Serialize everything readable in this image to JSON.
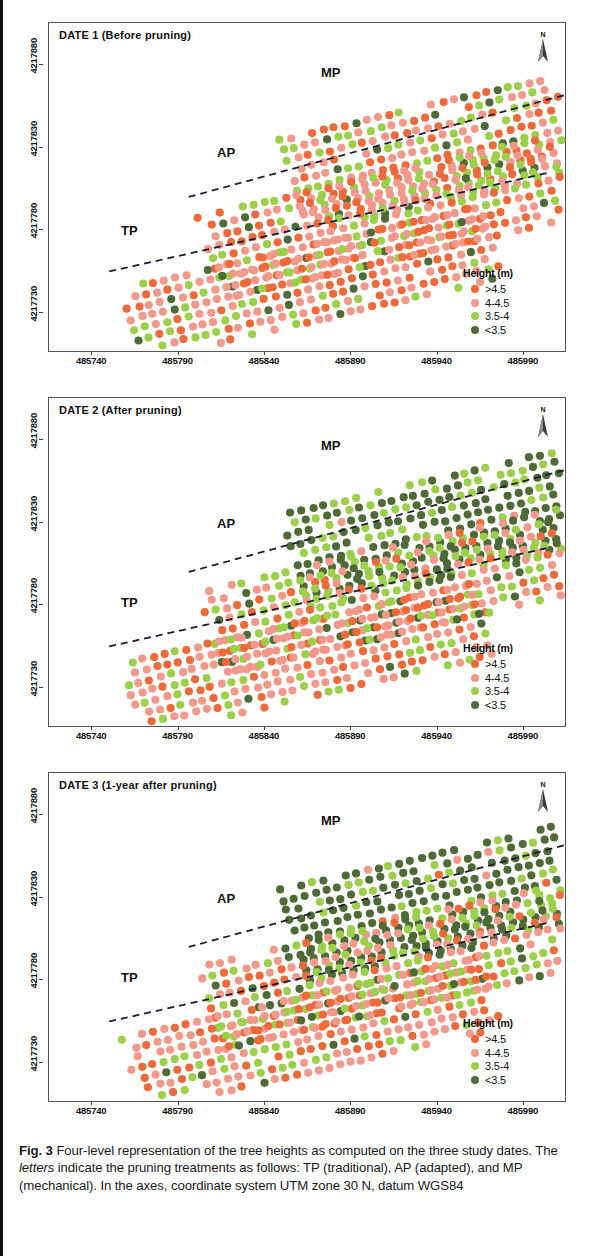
{
  "figure": {
    "caption_label": "Fig. 3",
    "caption_text": " Four-level representation of the tree heights as computed on the three study dates. The ",
    "caption_emphasis": "letters",
    "caption_text2": " indicate the pruning treatments as follows: TP (traditional), AP (adapted), and MP (mechanical). In the axes, coordinate system UTM zone 30 N, datum WGS84"
  },
  "legend": {
    "title": "Height (m)",
    "items": [
      {
        "label": ">4.5",
        "color": "#ee6a3a",
        "key": "h1"
      },
      {
        "label": "4-4.5",
        "color": "#f2998c",
        "key": "h2"
      },
      {
        "label": "3.5-4",
        "color": "#9ccf4a",
        "key": "h3"
      },
      {
        "label": "<3.5",
        "color": "#4e6b37",
        "key": "h4"
      }
    ]
  },
  "compass": {
    "label": "N",
    "icon": "north-arrow-icon"
  },
  "axes": {
    "x_ticks": [
      "485740",
      "485790",
      "485840",
      "485890",
      "485940",
      "485990"
    ],
    "x_min": 485715,
    "x_max": 486015,
    "y_ticks": [
      "4217880",
      "4217830",
      "4217780",
      "4217730"
    ],
    "y_min": 4217705,
    "y_max": 4217905
  },
  "zones": [
    {
      "key": "TP",
      "label": "TP",
      "name": "traditional"
    },
    {
      "key": "AP",
      "label": "AP",
      "name": "adapted"
    },
    {
      "key": "MP",
      "label": "MP",
      "name": "mechanical"
    }
  ],
  "panels": [
    {
      "id": "date1",
      "title": "DATE 1 (Before pruning)",
      "zone_labels": [
        {
          "key": "TP",
          "x": 72,
          "y": 200
        },
        {
          "key": "AP",
          "x": 168,
          "y": 122
        },
        {
          "key": "MP",
          "x": 272,
          "y": 42
        }
      ],
      "mix": {
        "TP": [
          0.3,
          0.46,
          0.18,
          0.06
        ],
        "AP": [
          0.33,
          0.4,
          0.2,
          0.07
        ],
        "MP": [
          0.26,
          0.34,
          0.3,
          0.1
        ]
      },
      "seed": 11
    },
    {
      "id": "date2",
      "title": "DATE 2 (After pruning)",
      "zone_labels": [
        {
          "key": "TP",
          "x": 72,
          "y": 197
        },
        {
          "key": "AP",
          "x": 168,
          "y": 118
        },
        {
          "key": "MP",
          "x": 272,
          "y": 40
        }
      ],
      "mix": {
        "TP": [
          0.3,
          0.44,
          0.2,
          0.06
        ],
        "AP": [
          0.2,
          0.34,
          0.28,
          0.18
        ],
        "MP": [
          0.01,
          0.03,
          0.26,
          0.7
        ]
      },
      "seed": 27
    },
    {
      "id": "date3",
      "title": "DATE 3 (1-year after pruning)",
      "zone_labels": [
        {
          "key": "TP",
          "x": 72,
          "y": 197
        },
        {
          "key": "AP",
          "x": 168,
          "y": 118
        },
        {
          "key": "MP",
          "x": 272,
          "y": 40
        }
      ],
      "mix": {
        "TP": [
          0.28,
          0.44,
          0.22,
          0.06
        ],
        "AP": [
          0.22,
          0.36,
          0.28,
          0.14
        ],
        "MP": [
          0.01,
          0.02,
          0.22,
          0.75
        ]
      },
      "seed": 43
    }
  ],
  "chart_data": {
    "type": "scatter",
    "xlabel": "UTM Easting (zone 30 N, WGS84)",
    "ylabel": "UTM Northing (zone 30 N, WGS84)",
    "xlim": [
      485715,
      486015
    ],
    "ylim": [
      4217705,
      4217905
    ],
    "grid": false,
    "legend_position": "bottom-right",
    "categories": [
      ">4.5",
      "4-4.5",
      "3.5-4",
      "<3.5"
    ],
    "category_colors": [
      "#ee6a3a",
      "#f2998c",
      "#9ccf4a",
      "#4e6b37"
    ],
    "panels": [
      {
        "name": "DATE 1 (Before pruning)",
        "zone_fractions": {
          "TP": {
            ">4.5": 0.3,
            "4-4.5": 0.46,
            "3.5-4": 0.18,
            "<3.5": 0.06
          },
          "AP": {
            ">4.5": 0.33,
            "4-4.5": 0.4,
            "3.5-4": 0.2,
            "<3.5": 0.07
          },
          "MP": {
            ">4.5": 0.26,
            "4-4.5": 0.34,
            "3.5-4": 0.3,
            "<3.5": 0.1
          }
        }
      },
      {
        "name": "DATE 2 (After pruning)",
        "zone_fractions": {
          "TP": {
            ">4.5": 0.3,
            "4-4.5": 0.44,
            "3.5-4": 0.2,
            "<3.5": 0.06
          },
          "AP": {
            ">4.5": 0.2,
            "4-4.5": 0.34,
            "3.5-4": 0.28,
            "<3.5": 0.18
          },
          "MP": {
            ">4.5": 0.01,
            "4-4.5": 0.03,
            "3.5-4": 0.26,
            "<3.5": 0.7
          }
        }
      },
      {
        "name": "DATE 3 (1-year after pruning)",
        "zone_fractions": {
          "TP": {
            ">4.5": 0.28,
            "4-4.5": 0.44,
            "3.5-4": 0.22,
            "<3.5": 0.06
          },
          "AP": {
            ">4.5": 0.22,
            "4-4.5": 0.36,
            "3.5-4": 0.28,
            "<3.5": 0.14
          },
          "MP": {
            ">4.5": 0.01,
            "4-4.5": 0.02,
            "3.5-4": 0.22,
            "<3.5": 0.75
          }
        }
      }
    ]
  }
}
